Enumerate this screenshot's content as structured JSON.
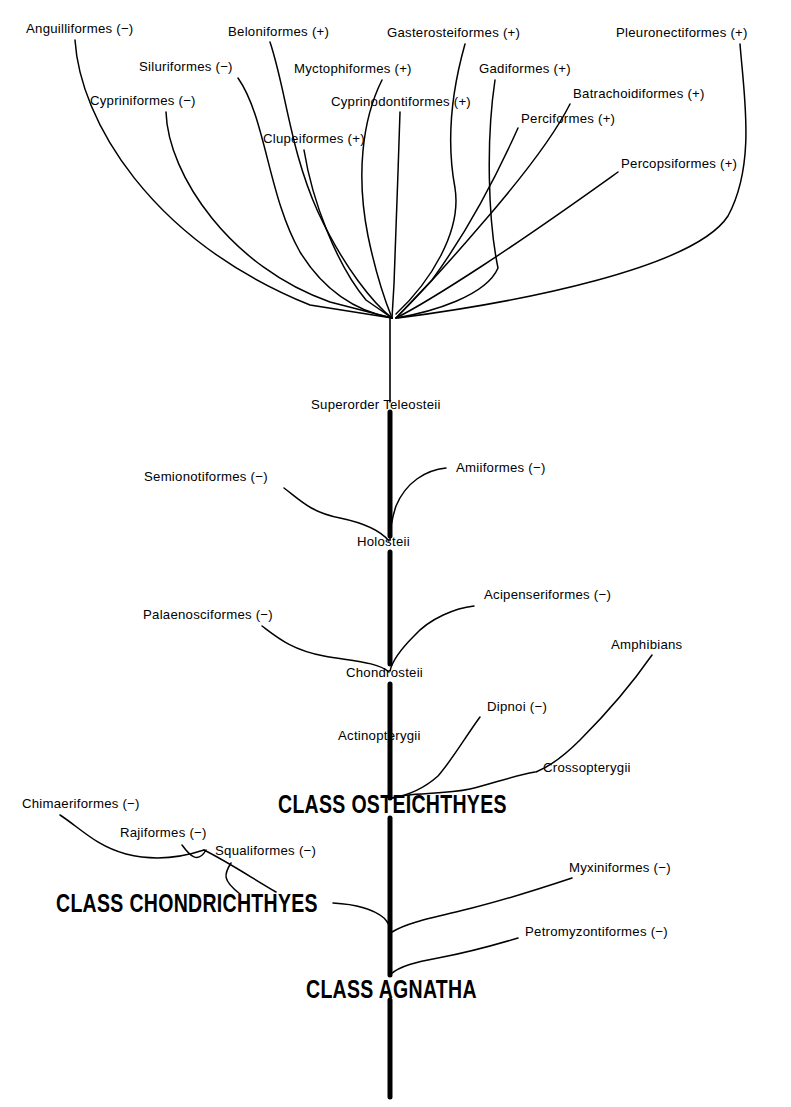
{
  "figure": {
    "type": "cladogram",
    "title_present": false,
    "background_color": "#ffffff",
    "line_color": "#000000",
    "notation": {
      "plus": "(+)",
      "minus": "(−)",
      "meaning_plus": "marked with plus sign",
      "meaning_minus": "marked with minus sign"
    }
  },
  "trunk": {
    "label_top": "Superorder Teleosteii",
    "nodes": [
      "Superorder Teleosteii",
      "Holosteii",
      "Chondrosteii",
      "Actinopterygii",
      "CLASS OSTEICHTHYES",
      "CLASS AGNATHA"
    ]
  },
  "teleost_fan": {
    "tips": [
      {
        "name": "Anguilliformes (−)"
      },
      {
        "name": "Siluriformes (−)"
      },
      {
        "name": "Cypriniformes (−)"
      },
      {
        "name": "Clupeiformes (+)"
      },
      {
        "name": "Beloniformes (+)"
      },
      {
        "name": "Myctophiformes (+)"
      },
      {
        "name": "Cyprinodontiformes (+)"
      },
      {
        "name": "Gasterosteiformes (+)"
      },
      {
        "name": "Gadiformes (+)"
      },
      {
        "name": "Perciformes (+)"
      },
      {
        "name": "Batrachoidiformes (+)"
      },
      {
        "name": "Percopsiformes (+)"
      },
      {
        "name": "Pleuronectiformes (+)"
      }
    ]
  },
  "labels": {
    "anguilliformes": "Anguilliformes (−)",
    "siluriformes": "Siluriformes (−)",
    "cypriniformes": "Cypriniformes (−)",
    "clupeiformes": "Clupeiformes (+)",
    "beloniformes": "Beloniformes (+)",
    "myctophiformes": "Myctophiformes (+)",
    "cyprinodontiformes": "Cyprinodontiformes (+)",
    "gasterosteiformes": "Gasterosteiformes (+)",
    "gadiformes": "Gadiformes (+)",
    "perciformes": "Perciformes (+)",
    "batrachoidiformes": "Batrachoidiformes (+)",
    "percopsiformes": "Percopsiformes (+)",
    "pleuronectiformes": "Pleuronectiformes (+)",
    "superorder_teleosteii": "Superorder Teleosteii",
    "semionotiformes": "Semionotiformes (−)",
    "amiiformes": "Amiiformes (−)",
    "holosteii": "Holosteii",
    "palaenosciformes": "Palaenosciformes (−)",
    "acipenseriformes": "Acipenseriformes (−)",
    "chondrosteii": "Chondrosteii",
    "actinopterygii": "Actinopterygii",
    "dipnoi": "Dipnoi (−)",
    "amphibians": "Amphibians",
    "crossopterygii": "Crossopterygii",
    "class_osteichthyes": "CLASS OSTEICHTHYES",
    "chimaeriformes": "Chimaeriformes (−)",
    "rajiformes": "Rajiformes (−)",
    "squaliformes": "Squaliformes (−)",
    "class_chondrichthyes": "CLASS CHONDRICHTHYES",
    "myxiniformes": "Myxiniformes (−)",
    "petromyzontiformes": "Petromyzontiformes (−)",
    "class_agnatha": "CLASS AGNATHA"
  }
}
